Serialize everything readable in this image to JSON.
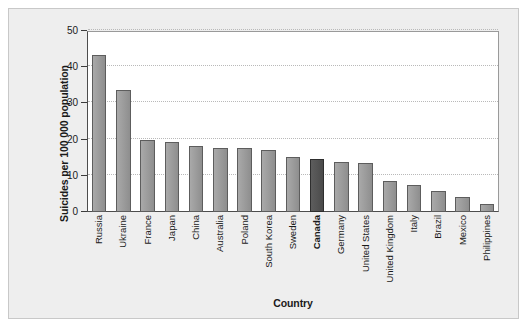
{
  "chart_data": {
    "type": "bar",
    "title": "",
    "xlabel": "Country",
    "ylabel": "Suicides per 100 000 population",
    "ylim": [
      0,
      50
    ],
    "yticks": [
      0,
      10,
      20,
      30,
      40,
      50
    ],
    "ytick_labels": [
      "0",
      "10",
      "20",
      "30",
      "40",
      "50"
    ],
    "grid": "horizontal dotted gridlines at 10, 20, 30, 40, 50",
    "legend": "none",
    "highlight_category": "Canada",
    "categories": [
      "Russia",
      "Ukraine",
      "France",
      "Japan",
      "China",
      "Australia",
      "Poland",
      "South Korea",
      "Sweden",
      "Canada",
      "Germany",
      "United States",
      "United Kingdom",
      "Italy",
      "Brazil",
      "Mexico",
      "Philippines"
    ],
    "values": [
      43.4,
      33.8,
      19.8,
      19.3,
      18.2,
      17.8,
      17.6,
      17.0,
      15.3,
      14.6,
      13.9,
      13.5,
      8.6,
      7.6,
      5.8,
      4.2,
      2.1
    ],
    "bar_colors": {
      "default": "#9d9d9d",
      "highlight": "#555555",
      "border": "#5d5d5d"
    },
    "panel_background": "#eeeeee",
    "plot_background": "#ffffff",
    "gridline_color": "#b9b9b9",
    "axis_color": "#4d4d4d"
  },
  "axes": {
    "y_title": "Suicides per 100 000 population",
    "x_title": "Country"
  }
}
